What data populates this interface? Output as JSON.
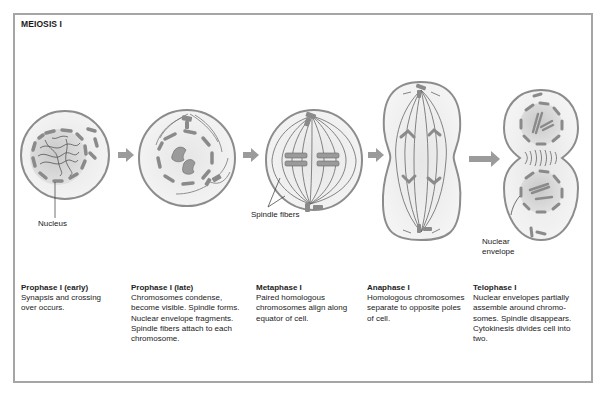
{
  "title": "MEIOSIS I",
  "labels": {
    "nucleus": "Nucleus",
    "spindle_fibers": "Spindle fibers",
    "nuclear_envelope_line1": "Nuclear",
    "nuclear_envelope_line2": "envelope"
  },
  "stages": [
    {
      "name": "Prophase I (early)",
      "description": "Synapsis and crossing over occurs."
    },
    {
      "name": "Prophase I (late)",
      "description": "Chromosomes condense, become visible. Spindle forms. Nuclear envelope fragments. Spindle fibers attach to each chromosome."
    },
    {
      "name": "Metaphase I",
      "description": "Paired homologous chromosomes align along equator of cell."
    },
    {
      "name": "Anaphase I",
      "description": "Homologous chromosomes separate to opposite poles of cell."
    },
    {
      "name": "Telophase I",
      "description": "Nuclear envelopes partially assemble around chromo-somes. Spindle disappears. Cytokinesis divides cell into two."
    }
  ],
  "colors": {
    "frame": "#a5a5a5",
    "cell_outline": "#8c8c8c",
    "cell_fill": "#eeeeee",
    "organelle": "#8a8a8a",
    "arrow": "#9b9b9b"
  }
}
